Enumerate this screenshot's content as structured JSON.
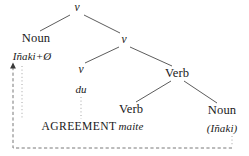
{
  "diagram": {
    "type": "syntax-tree",
    "title": "",
    "colors": {
      "background": "#ffffff",
      "text": "#1a1a1a",
      "tree_line": "#4a4a4a",
      "dashed_line": "#6a6a6a",
      "dotted_line": "#9a9a9a"
    },
    "nodes": {
      "root_v": "v",
      "noun_subject": "Noun",
      "subject_word": "Iñaki+Ø",
      "inner_v": "v",
      "little_v": "v",
      "little_v_word": "du",
      "verb_mid": "Verb",
      "verb_leaf": "Verb",
      "verb_leaf_word": "maite",
      "noun_object": "Noun",
      "object_word": "(Iñaki)"
    },
    "annotation": {
      "agreement_label": "AGREEMENT"
    }
  }
}
